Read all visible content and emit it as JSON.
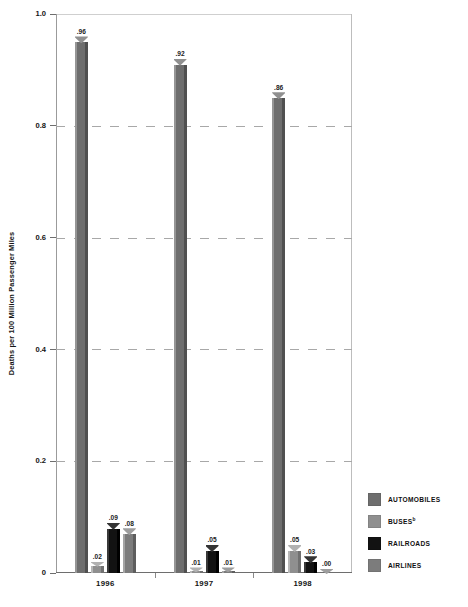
{
  "chart_data": {
    "type": "bar",
    "title": "",
    "subtitle": "",
    "xlabel": "",
    "ylabel": "Deaths per 100 Million Passenger Miles",
    "ylim": [
      0,
      1.0
    ],
    "yticks": [
      "0",
      "0.2",
      "0.4",
      "0.6",
      "0.8",
      "1.0"
    ],
    "ytick_values": [
      0,
      0.2,
      0.4,
      0.6,
      0.8,
      1.0
    ],
    "grid": "horizontal-dashed",
    "legend_position": "right-bottom",
    "categories": [
      "1996",
      "1997",
      "1998"
    ],
    "series": [
      {
        "name": "AUTOMOBILES",
        "color": "#6e6e6e",
        "values": [
          0.96,
          0.92,
          0.86
        ],
        "labels": [
          ".96",
          ".92",
          ".86"
        ]
      },
      {
        "name": "BUSES",
        "color": "#8f8f8f",
        "values": [
          0.02,
          0.01,
          0.05
        ],
        "labels": [
          ".02",
          ".01",
          ".05"
        ]
      },
      {
        "name": "RAILROADS",
        "color": "#121212",
        "values": [
          0.09,
          0.05,
          0.03
        ],
        "labels": [
          ".09",
          ".05",
          ".03"
        ]
      },
      {
        "name": "AIRLINES",
        "color": "#7c7c7c",
        "values": [
          0.08,
          0.01,
          0.0
        ],
        "labels": [
          ".08",
          ".01",
          ".00"
        ]
      }
    ]
  },
  "legend": {
    "items": [
      {
        "label": "AUTOMOBILES",
        "sup": "",
        "color": "#6e6e6e"
      },
      {
        "label": "BUSES",
        "sup": "b",
        "color": "#8f8f8f"
      },
      {
        "label": "RAILROADS",
        "sup": "",
        "color": "#121212"
      },
      {
        "label": "AIRLINES",
        "sup": "",
        "color": "#7c7c7c"
      }
    ]
  },
  "axis": {
    "y_title": "Deaths per 100 Million Passenger Miles",
    "y_labels": [
      "1.0",
      "0.8",
      "0.6",
      "0.4",
      "0.2",
      "0"
    ],
    "x_labels": [
      "1996",
      "1997",
      "1998"
    ]
  },
  "colors": {
    "automobiles": "#6e6e6e",
    "buses": "#8f8f8f",
    "railroads": "#121212",
    "airlines": "#7c7c7c",
    "gridline": "#a8a8a8",
    "axis": "#6e6e6e",
    "text": "#141414",
    "background": "#ffffff"
  }
}
